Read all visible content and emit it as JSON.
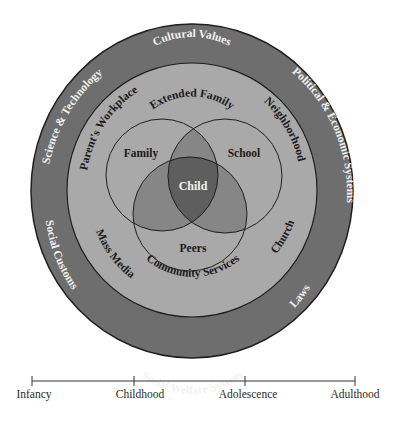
{
  "colors": {
    "outer_ring": "#6e6e6e",
    "middle_ring": "#a9a9a9",
    "venn_fill": "#a9a9a9",
    "pair_overlap": "#868686",
    "center_overlap": "#5e5e5e",
    "stroke": "#1f1f1f",
    "light_text": "#f2f2f2",
    "dark_text": "#1a1a1a"
  },
  "outer_ring": {
    "labels": {
      "top": "Cultural Values",
      "upper_left": "Science & Technology",
      "upper_right": "Political & Economic Systems",
      "lower_left": "Social Customs",
      "lower_right": "Laws",
      "bottom": "Social Welfare System"
    }
  },
  "middle_ring": {
    "labels": {
      "top": "Extended Family",
      "upper_left": "Parent's Workplace",
      "upper_right": "Neighborhood",
      "lower_left": "Mass Media",
      "lower_right": "Church",
      "bottom": "Community Services"
    }
  },
  "venn": {
    "family": "Family",
    "school": "School",
    "peers": "Peers",
    "center": "Child"
  },
  "timeline": {
    "stages": [
      "Infancy",
      "Childhood",
      "Adolescence",
      "Adulthood"
    ]
  }
}
